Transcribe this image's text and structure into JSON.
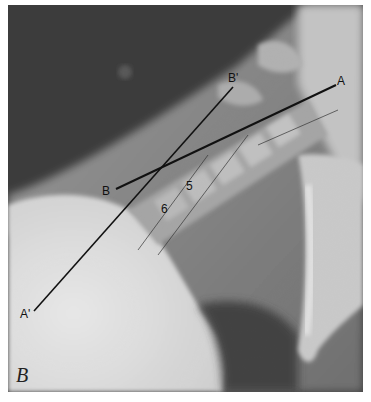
{
  "figure": {
    "panel_label": "B",
    "line_labels": {
      "a_top": "A",
      "a_bottom": "A'",
      "b_left": "B",
      "b_top": "B'"
    },
    "vertebra_labels": [
      "5",
      "6"
    ],
    "colors": {
      "background_dark": "#3a3a3a",
      "soft_tissue": "#8a8a8a",
      "bone_light": "#d8d8d8",
      "shoulder_bright": "#e6e6e6",
      "line": "#111111"
    }
  }
}
